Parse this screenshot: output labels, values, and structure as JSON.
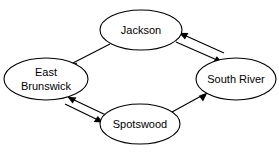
{
  "diagram": {
    "type": "directed-graph",
    "background_color": "#ffffff",
    "stroke_color": "#000000",
    "nodes": [
      {
        "id": "jackson",
        "label": "Jackson",
        "lines": [
          "Jackson"
        ],
        "shape": "ellipse",
        "cx": 141,
        "cy": 30,
        "rx": 41,
        "ry": 20
      },
      {
        "id": "east-brunswick",
        "label": "East Brunswick",
        "lines": [
          "East",
          "Brunswick"
        ],
        "shape": "ellipse",
        "cx": 46,
        "cy": 79,
        "rx": 42,
        "ry": 21
      },
      {
        "id": "south-river",
        "label": "South River",
        "lines": [
          "South River"
        ],
        "shape": "ellipse",
        "cx": 236,
        "cy": 79,
        "rx": 40,
        "ry": 21
      },
      {
        "id": "spotswood",
        "label": "Spotswood",
        "lines": [
          "Spotswood"
        ],
        "shape": "ellipse",
        "cx": 140,
        "cy": 124,
        "rx": 40,
        "ry": 20
      }
    ],
    "edges": [
      {
        "id": "jackson-to-east-brunswick",
        "from": "jackson",
        "to": "east-brunswick",
        "direction": "one-way",
        "arrow_at": "east-brunswick"
      },
      {
        "id": "jackson-south-river",
        "from": "jackson",
        "to": "south-river",
        "direction": "two-way",
        "arrow_at": "both"
      },
      {
        "id": "east-brunswick-spotswood",
        "from": "east-brunswick",
        "to": "spotswood",
        "direction": "two-way",
        "arrow_at": "both"
      },
      {
        "id": "spotswood-to-south-river",
        "from": "spotswood",
        "to": "south-river",
        "direction": "one-way",
        "arrow_at": "south-river"
      }
    ]
  }
}
